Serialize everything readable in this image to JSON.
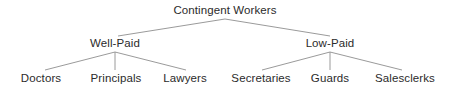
{
  "diagram": {
    "type": "hierarchy-tree",
    "title": "Contingent Workers",
    "background_color": "#ffffff",
    "text_color": "#2b2b2b",
    "line_color": "#8e8e8e",
    "nodes": {
      "root": {
        "label": "Contingent Workers",
        "x": 225,
        "y": 11
      },
      "branch_left": {
        "label": "Well-Paid",
        "x": 115,
        "y": 44
      },
      "branch_right": {
        "label": "Low-Paid",
        "x": 330,
        "y": 44
      },
      "leaf_1": {
        "label": "Doctors",
        "x": 41,
        "y": 79
      },
      "leaf_2": {
        "label": "Principals",
        "x": 116,
        "y": 79
      },
      "leaf_3": {
        "label": "Lawyers",
        "x": 185,
        "y": 79
      },
      "leaf_4": {
        "label": "Secretaries",
        "x": 261,
        "y": 79
      },
      "leaf_5": {
        "label": "Guards",
        "x": 330,
        "y": 79
      },
      "leaf_6": {
        "label": "Salesclerks",
        "x": 405,
        "y": 79
      }
    },
    "edges": [
      {
        "name": "root-to-well-paid",
        "x1": 225,
        "y1": 19,
        "x2": 118,
        "y2": 36
      },
      {
        "name": "root-to-low-paid",
        "x1": 225,
        "y1": 19,
        "x2": 330,
        "y2": 36
      },
      {
        "name": "well-paid-to-doctors",
        "x1": 115,
        "y1": 52,
        "x2": 45,
        "y2": 70
      },
      {
        "name": "well-paid-to-principals",
        "x1": 115,
        "y1": 52,
        "x2": 115,
        "y2": 70
      },
      {
        "name": "well-paid-to-lawyers",
        "x1": 115,
        "y1": 52,
        "x2": 186,
        "y2": 70
      },
      {
        "name": "low-paid-to-secretaries",
        "x1": 330,
        "y1": 52,
        "x2": 262,
        "y2": 70
      },
      {
        "name": "low-paid-to-guards",
        "x1": 330,
        "y1": 52,
        "x2": 330,
        "y2": 70
      },
      {
        "name": "low-paid-to-salesclerks",
        "x1": 330,
        "y1": 52,
        "x2": 402,
        "y2": 70
      }
    ]
  }
}
